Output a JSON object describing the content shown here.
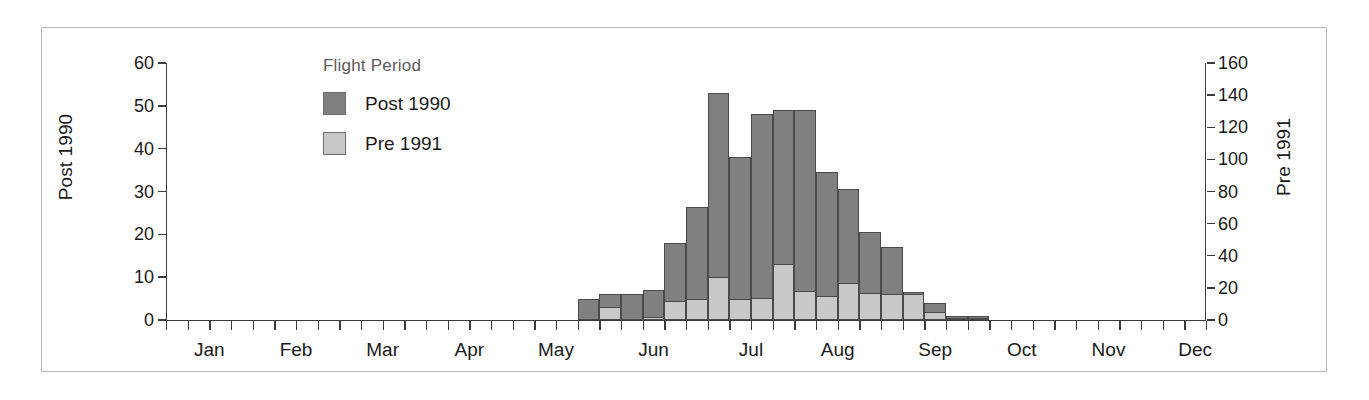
{
  "figure": {
    "background": "#ffffff",
    "frame_color": "#b9b9b9"
  },
  "legend": {
    "title": "Flight Period",
    "position": "top-left-inside",
    "items": [
      {
        "label": "Post 1990",
        "color": "#808080"
      },
      {
        "label": "Pre 1991",
        "color": "#c8c8c8"
      }
    ]
  },
  "chart_data": {
    "type": "bar",
    "stacked": true,
    "title": "",
    "xlabel": "",
    "ylabel": "Post 1990",
    "y2label": "Pre 1991",
    "grid": false,
    "legend_title": "Flight Period",
    "legend_position": "top-left-inside",
    "xlim_weeks": [
      0,
      48
    ],
    "ylim": [
      0,
      60
    ],
    "y2lim": [
      0,
      160
    ],
    "yticks": [
      0,
      10,
      20,
      30,
      40,
      50,
      60
    ],
    "y2ticks": [
      0,
      20,
      40,
      60,
      80,
      100,
      120,
      140,
      160
    ],
    "month_labels": [
      "Jan",
      "Feb",
      "Mar",
      "Apr",
      "May",
      "Jun",
      "Jul",
      "Aug",
      "Sep",
      "Oct",
      "Nov",
      "Dec"
    ],
    "month_label_week_centers": [
      2,
      6,
      10,
      14,
      18,
      22.5,
      27,
      31,
      35.5,
      39.5,
      43.5,
      47.5
    ],
    "xtick_weeks": [
      0,
      1,
      2,
      3,
      4,
      5,
      6,
      7,
      8,
      9,
      10,
      11,
      12,
      13,
      14,
      15,
      16,
      17,
      18,
      19,
      20,
      21,
      22,
      23,
      24,
      25,
      26,
      27,
      28,
      29,
      30,
      31,
      32,
      33,
      34,
      35,
      36,
      37,
      38,
      39,
      40,
      41,
      42,
      43,
      44,
      45,
      46,
      47,
      48
    ],
    "bar_width_weeks": 1,
    "series": [
      {
        "name": "Post 1990",
        "color": "#808080",
        "axis": "left",
        "units": "Post 1990 count (left axis, 0-60)",
        "values_by_week": {
          "19": 5,
          "20": 6,
          "21": 6,
          "22": 7,
          "23": 18,
          "24": 26.5,
          "25": 53,
          "26": 38,
          "27": 48,
          "28": 49,
          "29": 49,
          "30": 34.5,
          "31": 30.5,
          "32": 20.5,
          "33": 17,
          "34": 6.5,
          "35": 4,
          "36": 1,
          "37": 1
        }
      },
      {
        "name": "Pre 1991",
        "color": "#c8c8c8",
        "axis": "right",
        "units": "Pre 1991 count (right axis, 0-160)",
        "values_by_week": {
          "19": 0,
          "20": 8,
          "21": 0,
          "22": 2,
          "23": 12,
          "24": 13,
          "25": 27,
          "26": 13,
          "27": 14,
          "28": 35,
          "29": 18,
          "30": 15,
          "31": 23,
          "32": 17,
          "33": 16,
          "34": 16,
          "35": 5,
          "36": 1,
          "37": 1
        }
      }
    ],
    "bars": [
      {
        "week": 19,
        "post1990": 5,
        "pre1991": 0
      },
      {
        "week": 20,
        "post1990": 6,
        "pre1991": 8
      },
      {
        "week": 21,
        "post1990": 6,
        "pre1991": 0
      },
      {
        "week": 22,
        "post1990": 7,
        "pre1991": 2
      },
      {
        "week": 23,
        "post1990": 18,
        "pre1991": 12
      },
      {
        "week": 24,
        "post1990": 26.5,
        "pre1991": 13
      },
      {
        "week": 25,
        "post1990": 53,
        "pre1991": 27
      },
      {
        "week": 26,
        "post1990": 38,
        "pre1991": 13
      },
      {
        "week": 27,
        "post1990": 48,
        "pre1991": 14
      },
      {
        "week": 28,
        "post1990": 49,
        "pre1991": 35
      },
      {
        "week": 29,
        "post1990": 49,
        "pre1991": 18
      },
      {
        "week": 30,
        "post1990": 34.5,
        "pre1991": 15
      },
      {
        "week": 31,
        "post1990": 30.5,
        "pre1991": 23
      },
      {
        "week": 32,
        "post1990": 20.5,
        "pre1991": 17
      },
      {
        "week": 33,
        "post1990": 17,
        "pre1991": 16
      },
      {
        "week": 34,
        "post1990": 6.5,
        "pre1991": 16
      },
      {
        "week": 35,
        "post1990": 4,
        "pre1991": 5
      },
      {
        "week": 36,
        "post1990": 1,
        "pre1991": 1
      },
      {
        "week": 37,
        "post1990": 1,
        "pre1991": 1
      }
    ]
  }
}
